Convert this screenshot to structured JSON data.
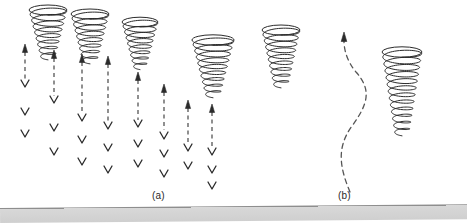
{
  "figure": {
    "width": 467,
    "height": 223,
    "background_color": "#ffffff",
    "ink_color": "#2b2b2b",
    "dash_color": "#555555",
    "scan_bar_color": "#cfcfcf"
  },
  "labels": {
    "panel_a": "(a)",
    "panel_b": "(b)"
  },
  "panels": [
    {
      "id": "a",
      "label": "(a)",
      "label_x": 152,
      "label_y": 190,
      "vortices": [
        {
          "name": "vortex-a1",
          "cx": 48,
          "top": 10,
          "bottom": 58,
          "top_rx": 19,
          "bottom_rx": 7,
          "turns": 8,
          "ry": 5.0
        },
        {
          "name": "vortex-a2",
          "cx": 90,
          "top": 14,
          "bottom": 62,
          "top_rx": 19,
          "bottom_rx": 7,
          "turns": 8,
          "ry": 5.0
        },
        {
          "name": "vortex-a3",
          "cx": 140,
          "top": 22,
          "bottom": 68,
          "top_rx": 18,
          "bottom_rx": 6,
          "turns": 8,
          "ry": 4.8
        },
        {
          "name": "vortex-a4",
          "cx": 213,
          "top": 40,
          "bottom": 96,
          "top_rx": 21,
          "bottom_rx": 7,
          "turns": 9,
          "ry": 5.2
        }
      ],
      "flow_columns": [
        {
          "name": "flow-column-1",
          "x": 25,
          "arrow_tip_y": 44,
          "dash_end_y": 80,
          "chevrons": [
            84,
            112,
            134
          ]
        },
        {
          "name": "flow-column-2",
          "x": 54,
          "arrow_tip_y": 50,
          "dash_end_y": 96,
          "chevrons": [
            100,
            128,
            152
          ]
        },
        {
          "name": "flow-column-3",
          "x": 82,
          "arrow_tip_y": 54,
          "dash_end_y": 112,
          "chevrons": [
            118,
            140,
            162
          ]
        },
        {
          "name": "flow-column-4",
          "x": 108,
          "arrow_tip_y": 56,
          "dash_end_y": 122,
          "chevrons": [
            126,
            148,
            170
          ]
        },
        {
          "name": "flow-column-5",
          "x": 138,
          "arrow_tip_y": 72,
          "dash_end_y": 120,
          "chevrons": [
            124,
            144,
            164
          ]
        },
        {
          "name": "flow-column-6",
          "x": 164,
          "arrow_tip_y": 84,
          "dash_end_y": 130,
          "chevrons": [
            136,
            154,
            174
          ]
        },
        {
          "name": "flow-column-7",
          "x": 188,
          "arrow_tip_y": 100,
          "dash_end_y": 144,
          "chevrons": [
            148,
            166
          ]
        },
        {
          "name": "flow-column-8",
          "x": 212,
          "arrow_tip_y": 104,
          "dash_end_y": 148,
          "chevrons": [
            152,
            170,
            186
          ]
        }
      ]
    },
    {
      "id": "b",
      "label": "(b)",
      "label_x": 338,
      "label_y": 190,
      "vortices": [
        {
          "name": "vortex-b1",
          "cx": 281,
          "top": 30,
          "bottom": 86,
          "top_rx": 19,
          "bottom_rx": 7,
          "turns": 9,
          "ry": 5.0
        },
        {
          "name": "vortex-b2",
          "cx": 402,
          "top": 52,
          "bottom": 134,
          "top_rx": 20,
          "bottom_rx": 7,
          "turns": 12,
          "ry": 5.2
        }
      ],
      "curved_flow": {
        "name": "curved-flow-arrow",
        "description": "S-shaped dashed updraft arrow",
        "start_x": 350,
        "start_y": 192,
        "end_x": 344,
        "end_y": 32
      }
    }
  ],
  "chart_data": {
    "type": "diagram",
    "title": "",
    "subtitle": "",
    "panel_count": 2,
    "panel_labels": [
      "(a)",
      "(b)"
    ],
    "element_counts": {
      "panel_a_vortices": 4,
      "panel_a_flow_arrows": 8,
      "panel_b_vortices": 2,
      "panel_b_flow_arrows": 1
    }
  }
}
